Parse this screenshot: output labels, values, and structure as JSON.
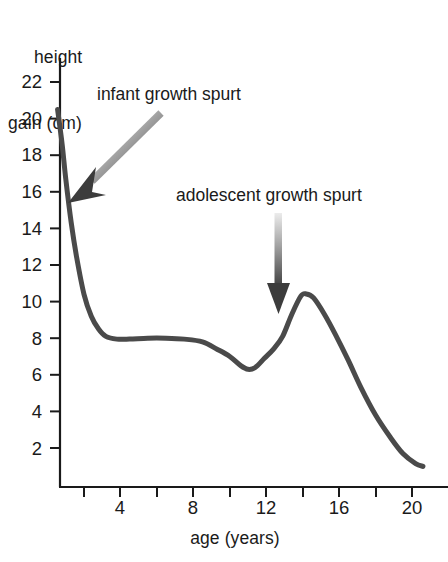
{
  "chart_data": {
    "type": "line",
    "title": "",
    "subtitle": "",
    "xlabel": "age (years)",
    "ylabel_line1": "height",
    "ylabel_line2": "gain (cm)",
    "ylabel": "height gain (cm)",
    "xlim": [
      0,
      21
    ],
    "ylim": [
      0,
      23
    ],
    "grid": false,
    "legend": "none",
    "x_ticks_major": [
      4,
      8,
      12,
      16,
      20
    ],
    "x_ticks_minor": [
      2,
      6,
      10,
      14,
      18
    ],
    "x_tick_labels": [
      "4",
      "8",
      "12",
      "16",
      "20"
    ],
    "y_ticks": [
      2,
      4,
      6,
      8,
      10,
      12,
      14,
      16,
      18,
      20,
      22
    ],
    "y_tick_labels": [
      "2",
      "4",
      "6",
      "8",
      "10",
      "12",
      "14",
      "16",
      "18",
      "20",
      "22"
    ],
    "line_color": "#4a4a4a",
    "line_width": 5,
    "series": [
      {
        "name": "height velocity",
        "x": [
          0.55,
          0.8,
          1.0,
          1.3,
          1.6,
          2.0,
          2.4,
          2.8,
          3.2,
          3.8,
          4.5,
          5.5,
          6.5,
          7.5,
          8.5,
          9.3,
          10.0,
          10.6,
          11.0,
          11.4,
          11.9,
          12.4,
          12.9,
          13.4,
          13.9,
          14.2,
          14.6,
          15.2,
          15.8,
          16.5,
          17.2,
          18.0,
          18.8,
          19.5,
          20.2,
          20.6
        ],
        "y": [
          20.5,
          18.6,
          16.7,
          14.3,
          12.4,
          10.4,
          9.2,
          8.5,
          8.1,
          7.95,
          7.95,
          8.0,
          8.0,
          7.95,
          7.8,
          7.4,
          7.0,
          6.5,
          6.3,
          6.4,
          6.9,
          7.4,
          8.1,
          9.3,
          10.3,
          10.42,
          10.2,
          9.3,
          8.2,
          6.8,
          5.3,
          3.8,
          2.6,
          1.7,
          1.15,
          1.0
        ]
      }
    ],
    "annotations": [
      {
        "name": "infant-growth-spurt",
        "text": "infant growth spurt",
        "arrow": "diagonal-down-left",
        "points_to_x": 1.2,
        "points_to_y": 16.2
      },
      {
        "name": "adolescent-growth-spurt",
        "text": "adolescent growth spurt",
        "arrow": "vertical-down",
        "points_to_x": 13.0,
        "points_to_y": 11.0
      }
    ]
  },
  "axes": {
    "x_axis_name": "age-axis",
    "y_axis_name": "height-gain-axis"
  }
}
